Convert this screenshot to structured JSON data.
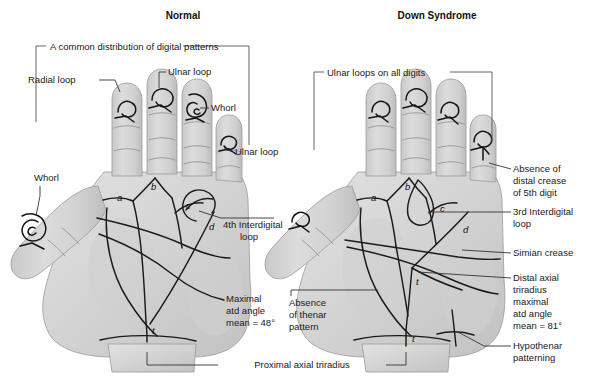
{
  "figure": {
    "type": "medical-diagram",
    "background_color": "#ffffff",
    "skin_color": "#d5d5d5",
    "line_color": "#1b1b1b",
    "text_color": "#1a1a1a"
  },
  "panels": [
    {
      "id": "normal",
      "title": "Normal",
      "bracket_label": "A common distribution of digital patterns",
      "digit_patterns": [
        {
          "digit": "thumb",
          "pattern": "Whorl"
        },
        {
          "digit": "index",
          "pattern": "Radial loop"
        },
        {
          "digit": "middle",
          "pattern": "Ulnar loop"
        },
        {
          "digit": "ring",
          "pattern": "Whorl"
        },
        {
          "digit": "little",
          "pattern": "Ulnar loop"
        }
      ],
      "labels": [
        "Radial loop",
        "Ulnar loop",
        "Whorl",
        "Ulnar loop",
        "Whorl",
        "4th Interdigital loop"
      ],
      "triradii": [
        "a",
        "b",
        "c",
        "d",
        "t"
      ],
      "atd": {
        "text_lines": [
          "Maximal",
          "atd angle",
          "mean = 48°"
        ],
        "value": 48,
        "unit": "degrees"
      }
    },
    {
      "id": "down-syndrome",
      "title": "Down Syndrome",
      "bracket_label": "Ulnar loops on all digits",
      "digit_patterns": [
        {
          "digit": "thumb",
          "pattern": "Ulnar loop"
        },
        {
          "digit": "index",
          "pattern": "Ulnar loop"
        },
        {
          "digit": "middle",
          "pattern": "Ulnar loop"
        },
        {
          "digit": "ring",
          "pattern": "Ulnar loop"
        },
        {
          "digit": "little",
          "pattern": "Ulnar loop"
        }
      ],
      "labels": [
        "Absence of distal crease of 5th digit",
        "3rd Interdigital loop",
        "Simian crease",
        "Hypothenar patterning",
        "Absence of thenar pattern"
      ],
      "triradii": [
        "a",
        "b",
        "c",
        "d",
        "t"
      ],
      "atd": {
        "text_lines": [
          "Distal axial",
          "triradius",
          "maximal",
          "atd angle",
          "mean = 81°"
        ],
        "value": 81,
        "unit": "degrees"
      }
    }
  ],
  "annotations": {
    "normal": {
      "radial_loop": "Radial loop",
      "ulnar_loop_middle": "Ulnar loop",
      "whorl_ring": "Whorl",
      "ulnar_loop_little": "Ulnar loop",
      "whorl_thumb": "Whorl",
      "interdigital_4th_line1": "4th Interdigital",
      "interdigital_4th_line2": "loop",
      "atd_line1": "Maximal",
      "atd_line2": "atd angle",
      "atd_line3": "mean = 48°"
    },
    "down": {
      "absence_crease_line1": "Absence of",
      "absence_crease_line2": "distal crease",
      "absence_crease_line3": "of 5th digit",
      "interdigital_3rd_line1": "3rd Interdigital",
      "interdigital_3rd_line2": "loop",
      "simian": "Simian crease",
      "atd_line1": "Distal axial",
      "atd_line2": "triradius",
      "atd_line3": "maximal",
      "atd_line4": "atd angle",
      "atd_line5": "mean = 81°",
      "hypothenar_line1": "Hypothenar",
      "hypothenar_line2": "patterning",
      "thenar_line1": "Absence",
      "thenar_line2": "of thenar",
      "thenar_line3": "pattern"
    },
    "shared": {
      "proximal_axial_triradius": "Proximal axial triradius"
    },
    "triradius_letters": {
      "a": "a",
      "b": "b",
      "c": "c",
      "d": "d",
      "t": "t"
    }
  }
}
